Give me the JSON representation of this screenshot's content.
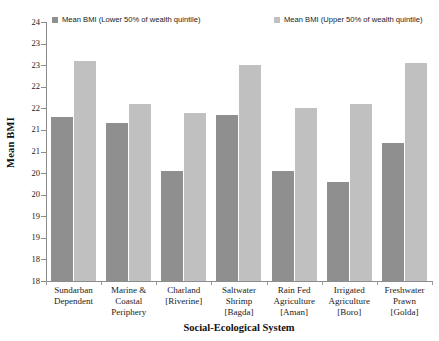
{
  "chart_data": {
    "type": "bar",
    "title": "",
    "xlabel": "Social-Ecological System",
    "ylabel": "Mean BMI",
    "ylim": [
      18,
      24
    ],
    "ytick_step": 0.5,
    "grid": false,
    "legend_position": "top",
    "categories": [
      "Sundarban Dependent",
      "Marine & Coastal Periphery",
      "Charland [Riverine]",
      "Saltwater Shrimp [Bagda]",
      "Rain Fed Agriculture [Aman]",
      "Irrigated Agriculture [Boro]",
      "Freshwater Prawn [Golda]"
    ],
    "category_lines": [
      [
        "Sundarban",
        "Dependent"
      ],
      [
        "Marine &",
        "Coastal",
        "Periphery"
      ],
      [
        "Charland",
        "[Riverine]"
      ],
      [
        "Saltwater",
        "Shrimp",
        "[Bagda]"
      ],
      [
        "Rain Fed",
        "Agriculture",
        "[Aman]"
      ],
      [
        "Irrigated",
        "Agriculture",
        "[Boro]"
      ],
      [
        "Freshwater",
        "Prawn",
        "[Golda]"
      ]
    ],
    "ytick_labels": [
      "24",
      "23",
      "23",
      "22",
      "22",
      "21",
      "21",
      "20",
      "20",
      "19",
      "19",
      "18"
    ],
    "ytick_values": [
      24,
      23.5,
      23,
      22.5,
      22,
      21.5,
      21,
      20.5,
      20,
      19.5,
      19,
      18.5,
      18
    ],
    "series": [
      {
        "name": "Mean BMI (Lower 50% of wealth quintile)",
        "color": "#8f8f8f",
        "values": [
          21.8,
          21.65,
          20.55,
          21.85,
          20.55,
          20.3,
          21.2
        ]
      },
      {
        "name": "Mean BMI (Upper 50% of wealth quintile)",
        "color": "#c0c0c0",
        "values": [
          23.1,
          22.1,
          21.9,
          23.0,
          22.0,
          22.1,
          23.05
        ]
      }
    ]
  },
  "legend": {
    "items": [
      {
        "label": "Mean BMI (Lower 50% of wealth quintile)",
        "color": "#8f8f8f"
      },
      {
        "label": "Mean BMI (Upper 50% of wealth quintile)",
        "color": "#c0c0c0"
      }
    ]
  },
  "axes": {
    "y_title": "Mean BMI",
    "x_title": "Social-Ecological System"
  }
}
